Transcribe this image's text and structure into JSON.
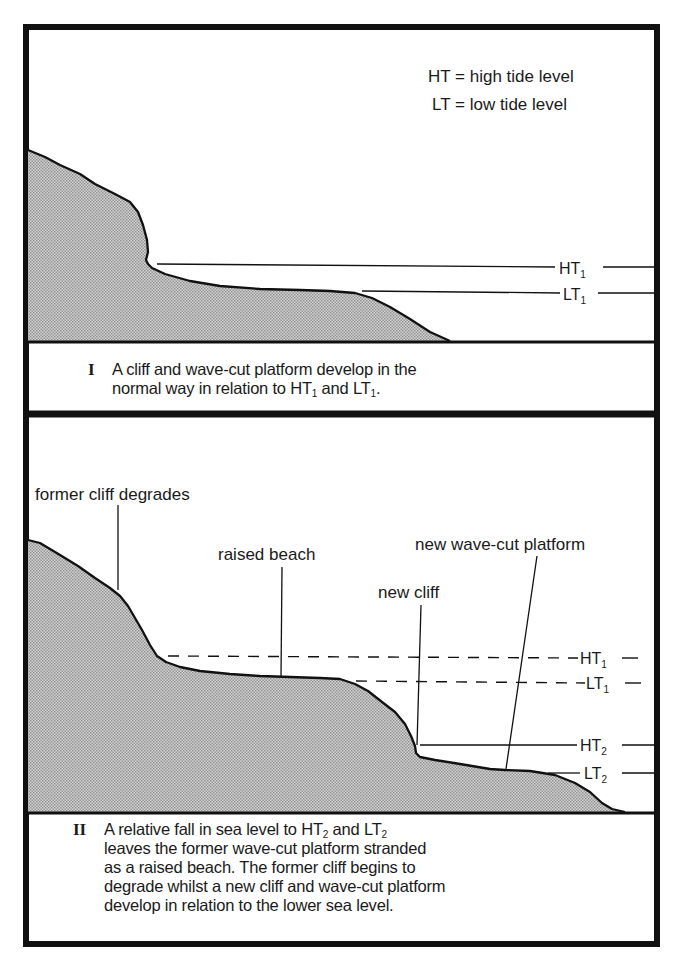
{
  "legend": {
    "ht": "HT = high tide level",
    "lt": "LT = low tide level"
  },
  "panel_1": {
    "number": "I",
    "levels": {
      "ht_main": "HT",
      "ht_sub": "1",
      "lt_main": "LT",
      "lt_sub": "1"
    },
    "caption": {
      "line1": "A cliff and wave-cut platform develop in the",
      "line2_pre": "normal way in relation to HT",
      "line2_sub1": "1",
      "line2_mid": " and LT",
      "line2_sub2": "1",
      "line2_post": "."
    }
  },
  "panel_2": {
    "number": "II",
    "labels": {
      "former_cliff": "former cliff degrades",
      "raised_beach": "raised beach",
      "new_cliff": "new cliff",
      "new_platform": "new wave-cut platform"
    },
    "levels": {
      "ht1_main": "HT",
      "ht1_sub": "1",
      "lt1_main": "LT",
      "lt1_sub": "1",
      "ht2_main": "HT",
      "ht2_sub": "2",
      "lt2_main": "LT",
      "lt2_sub": "2"
    },
    "caption": {
      "line1_pre": "A relative fall in sea level to HT",
      "line1_sub1": "2",
      "line1_mid": " and LT",
      "line1_sub2": "2",
      "line2": "leaves the former wave-cut platform stranded",
      "line3": "as a raised beach. The former cliff begins to",
      "line4": "degrade whilst a new cliff and wave-cut platform",
      "line5": "develop in relation to the lower sea level."
    }
  },
  "colors": {
    "border": "#111111",
    "land_fill": "#c9c9c9",
    "land_dot": "#8a8a8a",
    "text": "#1a1a1a"
  }
}
